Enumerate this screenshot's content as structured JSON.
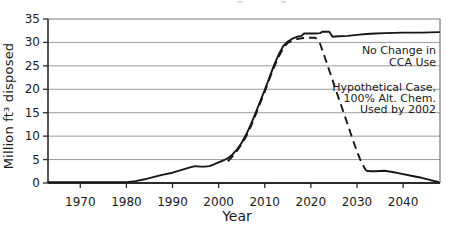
{
  "figure": {
    "background": "#ffffff",
    "y_axis_label": "Million ft³ disposed",
    "x_axis_label": "Year"
  },
  "labels": {
    "no_change": {
      "lines": [
        "No Change in",
        "CCA Use"
      ]
    },
    "hypothetical": {
      "lines": [
        "Hypothetical Case,",
        "100% Alt. Chem.",
        "Used by 2002"
      ]
    }
  },
  "colors": {
    "line": "#161616",
    "grid": "#9b9b9b",
    "axis": "#2a2a2a",
    "border": "#777777",
    "text": "#1a1a1a"
  },
  "chart_data": {
    "type": "line",
    "title": "",
    "xlabel": "Year",
    "ylabel": "Million ft³ disposed",
    "xlim": [
      1963,
      2048
    ],
    "ylim": [
      0,
      35
    ],
    "x_ticks": [
      1970,
      1980,
      1990,
      2000,
      2010,
      2020,
      2030,
      2040
    ],
    "y_ticks": [
      0,
      5,
      10,
      15,
      20,
      25,
      30,
      35
    ],
    "grid": "horizontal",
    "legend_position": "inside-right",
    "series": [
      {
        "name": "No Change in CCA Use",
        "style": "solid",
        "points": [
          [
            1963,
            0.2
          ],
          [
            1968,
            0.2
          ],
          [
            1972,
            0.2
          ],
          [
            1976,
            0.2
          ],
          [
            1980,
            0.2
          ],
          [
            1982,
            0.4
          ],
          [
            1984,
            0.8
          ],
          [
            1986,
            1.3
          ],
          [
            1988,
            1.8
          ],
          [
            1990,
            2.2
          ],
          [
            1992,
            2.8
          ],
          [
            1994,
            3.4
          ],
          [
            1995,
            3.6
          ],
          [
            1996,
            3.5
          ],
          [
            1997,
            3.5
          ],
          [
            1998,
            3.6
          ],
          [
            1999,
            4.0
          ],
          [
            2000,
            4.4
          ],
          [
            2001,
            4.8
          ],
          [
            2002,
            5.3
          ],
          [
            2003,
            6.1
          ],
          [
            2004,
            7.2
          ],
          [
            2005,
            8.6
          ],
          [
            2006,
            10.4
          ],
          [
            2007,
            12.5
          ],
          [
            2008,
            14.9
          ],
          [
            2009,
            17.4
          ],
          [
            2010,
            19.9
          ],
          [
            2011,
            22.5
          ],
          [
            2012,
            25.1
          ],
          [
            2013,
            27.4
          ],
          [
            2014,
            29.2
          ],
          [
            2015,
            30.2
          ],
          [
            2016,
            30.8
          ],
          [
            2017,
            31.2
          ],
          [
            2018,
            31.4
          ],
          [
            2018.5,
            31.9
          ],
          [
            2020,
            31.9
          ],
          [
            2021,
            31.9
          ],
          [
            2022,
            32.0
          ],
          [
            2022.5,
            32.3
          ],
          [
            2024,
            32.3
          ],
          [
            2024.7,
            31.2
          ],
          [
            2026,
            31.3
          ],
          [
            2028,
            31.4
          ],
          [
            2030,
            31.6
          ],
          [
            2032,
            31.8
          ],
          [
            2034,
            31.9
          ],
          [
            2036,
            32.0
          ],
          [
            2040,
            32.1
          ],
          [
            2044,
            32.1
          ],
          [
            2047.8,
            32.2
          ]
        ]
      },
      {
        "name": "Hypothetical Case, 100% Alt. Chem. Used by 2002",
        "style": "dashed",
        "dash_end_year": 2032,
        "points": [
          [
            2002,
            4.6
          ],
          [
            2003,
            5.7
          ],
          [
            2004,
            6.9
          ],
          [
            2005,
            8.3
          ],
          [
            2006,
            10.0
          ],
          [
            2007,
            12.1
          ],
          [
            2008,
            14.5
          ],
          [
            2009,
            17.0
          ],
          [
            2010,
            19.5
          ],
          [
            2011,
            22.2
          ],
          [
            2012,
            24.7
          ],
          [
            2013,
            26.9
          ],
          [
            2014,
            28.8
          ],
          [
            2015,
            29.9
          ],
          [
            2016,
            30.4
          ],
          [
            2017,
            30.7
          ],
          [
            2018,
            30.9
          ],
          [
            2019,
            31.0
          ],
          [
            2020,
            31.0
          ],
          [
            2021,
            31.0
          ],
          [
            2022,
            29.7
          ],
          [
            2023,
            26.9
          ],
          [
            2024,
            24.0
          ],
          [
            2025,
            21.1
          ],
          [
            2026,
            18.2
          ],
          [
            2027,
            15.3
          ],
          [
            2028,
            12.4
          ],
          [
            2029,
            9.5
          ],
          [
            2030,
            6.7
          ],
          [
            2031,
            4.3
          ],
          [
            2032,
            2.6
          ],
          [
            2033,
            2.5
          ],
          [
            2034,
            2.5
          ],
          [
            2036,
            2.6
          ],
          [
            2038,
            2.3
          ],
          [
            2040,
            1.9
          ],
          [
            2042,
            1.5
          ],
          [
            2044,
            1.1
          ],
          [
            2046,
            0.6
          ],
          [
            2047.8,
            0.2
          ]
        ]
      }
    ]
  }
}
